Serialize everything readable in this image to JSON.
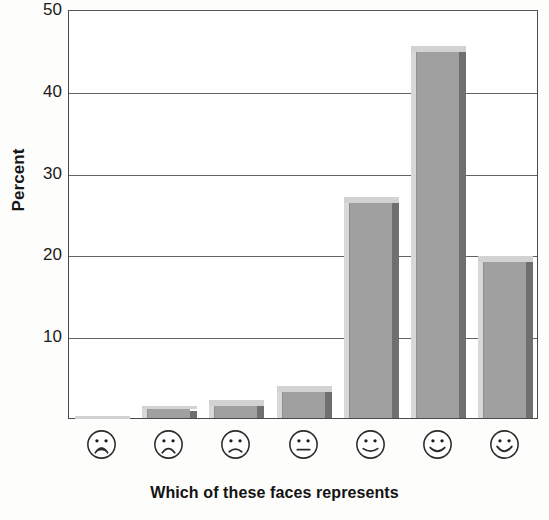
{
  "chart_data": {
    "type": "bar",
    "title": "",
    "subtitle": "",
    "xlabel": "Which of these faces represents",
    "ylabel": "Percent",
    "categories": [
      "very-unhappy-face",
      "unhappy-face",
      "slightly-unhappy-face",
      "neutral-face",
      "slightly-happy-face",
      "happy-face",
      "very-happy-face"
    ],
    "category_labels": [
      "Face 1 (most negative)",
      "Face 2",
      "Face 3",
      "Face 4 (neutral)",
      "Face 5",
      "Face 6",
      "Face 7 (most positive)"
    ],
    "values": [
      0.2,
      1.5,
      2.2,
      3.9,
      27.0,
      45.5,
      19.8
    ],
    "ylim": [
      0,
      50
    ],
    "yticks": [
      10,
      20,
      30,
      40,
      50
    ],
    "ytick_labels": [
      "10",
      "20",
      "30",
      "40",
      "50"
    ],
    "grid": true,
    "grid_axis": "y",
    "legend": false,
    "legend_position": "none",
    "bar_style": "3d-shaded",
    "colors": {
      "bar_face": "#a0a0a0",
      "bar_top_highlight": "#d2d2d2",
      "bar_left_highlight": "#d8d8d8",
      "bar_right_shadow": "#6f6f6f",
      "axis": "#4a4a4a",
      "gridline": "#636363",
      "text": "#1a1a1a",
      "background": "#ffffff"
    }
  },
  "axes": {
    "y_title": "Percent",
    "x_title": "Which of these faces represents"
  },
  "faces": [
    {
      "name": "very-unhappy-face",
      "expression": "frown-open-mouth"
    },
    {
      "name": "unhappy-face",
      "expression": "frown"
    },
    {
      "name": "slightly-unhappy-face",
      "expression": "slight-frown"
    },
    {
      "name": "neutral-face",
      "expression": "flat-line"
    },
    {
      "name": "slightly-happy-face",
      "expression": "slight-smile"
    },
    {
      "name": "happy-face",
      "expression": "smile"
    },
    {
      "name": "very-happy-face",
      "expression": "big-smile"
    }
  ]
}
